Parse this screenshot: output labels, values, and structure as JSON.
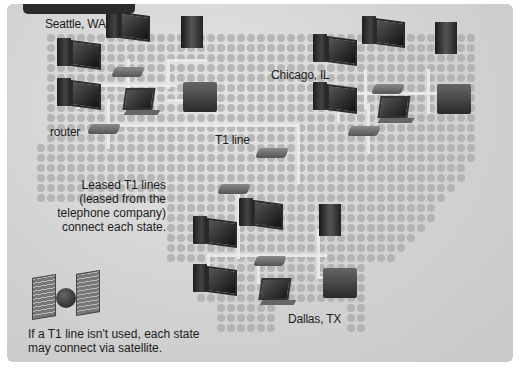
{
  "header": {
    "tab_text": ""
  },
  "locations": {
    "seattle": "Seattle, WA",
    "chicago": "Chicago, IL",
    "dallas": "Dallas, TX"
  },
  "labels": {
    "router": "router",
    "t1_line": "T1 line"
  },
  "captions": {
    "leased": [
      "Leased T1 lines",
      "(leased from the",
      "telephone company)",
      "connect each state."
    ],
    "satellite": [
      "If a T1 line isn't used, each state",
      "may connect via satellite."
    ]
  },
  "colors": {
    "panel_bg": "#d2d2d2",
    "tab_bg": "#2b2b2b",
    "dot": "#aaaaaa",
    "text": "#1c1c1c"
  },
  "icons": [
    "desktop-computer-icon",
    "tower-computer-icon",
    "laptop-icon",
    "router-icon",
    "server-icon",
    "satellite-icon"
  ]
}
